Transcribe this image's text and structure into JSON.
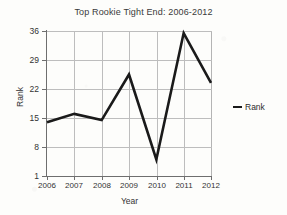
{
  "chart_data": {
    "type": "line",
    "title": "Top Rookie Tight End: 2006-2012",
    "xlabel": "Year",
    "ylabel": "Rank",
    "categories": [
      "2006",
      "2007",
      "2008",
      "2009",
      "2010",
      "2011",
      "2012"
    ],
    "values": [
      14,
      16,
      14.5,
      25.5,
      5,
      35.5,
      23.5
    ],
    "series": [
      {
        "name": "Rank",
        "values": [
          14,
          16,
          14.5,
          25.5,
          5,
          35.5,
          23.5
        ],
        "color": "#1a1a1a"
      }
    ],
    "ylim": [
      1,
      36
    ],
    "yticks": [
      "1",
      "8",
      "15",
      "22",
      "29",
      "36"
    ],
    "xticks": [
      "2006",
      "2007",
      "2008",
      "2009",
      "2010",
      "2011",
      "2012"
    ],
    "grid": true,
    "legend_position": "right",
    "legend_entries": [
      "Rank"
    ]
  },
  "legend": {
    "marker_name": "line-marker",
    "label": "Rank"
  }
}
